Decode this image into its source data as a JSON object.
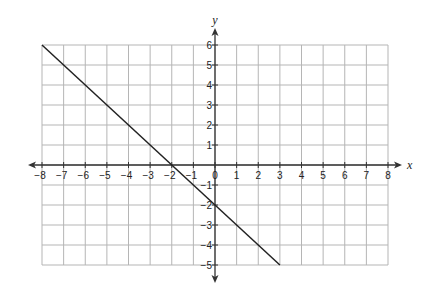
{
  "chart_data": {
    "type": "line",
    "title": "",
    "xlabel": "x",
    "ylabel": "y",
    "xlim": [
      -8,
      8
    ],
    "ylim": [
      -5,
      6
    ],
    "grid": true,
    "x_ticks": [
      -8,
      -7,
      -6,
      -5,
      -4,
      -3,
      -2,
      -1,
      0,
      1,
      2,
      3,
      4,
      5,
      6,
      7,
      8
    ],
    "y_ticks": [
      -5,
      -4,
      -3,
      -2,
      -1,
      1,
      2,
      3,
      4,
      5,
      6
    ],
    "series": [
      {
        "name": "line",
        "x": [
          -8,
          3
        ],
        "y": [
          6,
          -5
        ],
        "equation": "y = -x - 2",
        "color": "#222222"
      }
    ]
  },
  "colors": {
    "grid": "#b5b5b5",
    "axis": "#333333",
    "line": "#222222"
  }
}
